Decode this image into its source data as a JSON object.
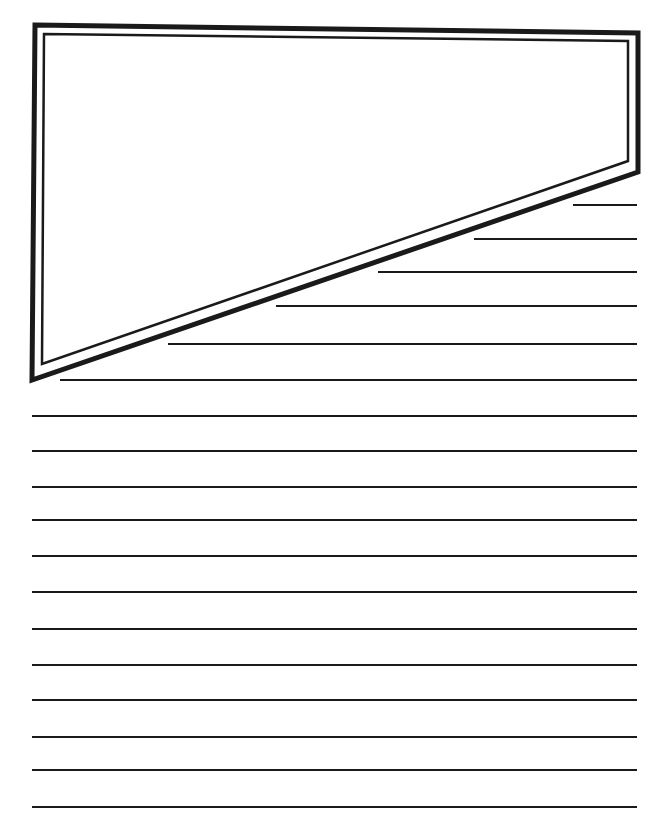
{
  "page": {
    "width": 667,
    "height": 840,
    "background": "#ffffff",
    "ink_color": "#1a1a1a"
  },
  "frame": {
    "outer": [
      [
        35,
        25
      ],
      [
        638,
        33
      ],
      [
        638,
        172
      ],
      [
        32,
        380
      ]
    ],
    "inner": [
      [
        44,
        34
      ],
      [
        628,
        41
      ],
      [
        628,
        161
      ],
      [
        42,
        364
      ]
    ],
    "outer_stroke": 5,
    "inner_stroke": 2.5
  },
  "writing_lines": {
    "right_x": 637,
    "stroke": 2.2,
    "lines": [
      {
        "y": 205,
        "x1": 573
      },
      {
        "y": 239,
        "x1": 474
      },
      {
        "y": 272,
        "x1": 378
      },
      {
        "y": 306,
        "x1": 276
      },
      {
        "y": 344,
        "x1": 168
      },
      {
        "y": 380,
        "x1": 60
      },
      {
        "y": 416,
        "x1": 32
      },
      {
        "y": 451,
        "x1": 32
      },
      {
        "y": 487,
        "x1": 32
      },
      {
        "y": 520,
        "x1": 32
      },
      {
        "y": 556,
        "x1": 32
      },
      {
        "y": 592,
        "x1": 32
      },
      {
        "y": 629,
        "x1": 32
      },
      {
        "y": 665,
        "x1": 32
      },
      {
        "y": 700,
        "x1": 32
      },
      {
        "y": 737,
        "x1": 32
      },
      {
        "y": 770,
        "x1": 32
      },
      {
        "y": 807,
        "x1": 32
      }
    ]
  }
}
